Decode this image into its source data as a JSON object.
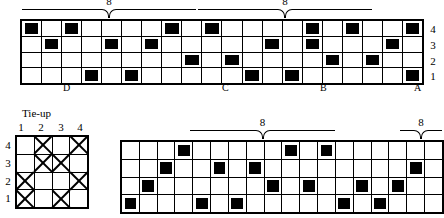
{
  "chart_data": {
    "type": "table",
    "grids": [
      {
        "name": "threading-draft",
        "rows": 4,
        "cols": 20,
        "row_labels": [
          "4",
          "3",
          "2",
          "1"
        ],
        "filled": [
          [
            1,
            3,
            8,
            10,
            15,
            17,
            20
          ],
          [
            2,
            5,
            7,
            13,
            15,
            19
          ],
          [
            9,
            11,
            16,
            18
          ],
          [
            4,
            6,
            12,
            14,
            20
          ]
        ],
        "letters": [
          {
            "label": "D",
            "col": 4
          },
          {
            "label": "C",
            "col": 12
          },
          {
            "label": "B",
            "col": 17
          },
          {
            "label": "A",
            "col": 20
          }
        ],
        "brackets": [
          {
            "label": "8",
            "start_col": 4,
            "end_col": 12
          },
          {
            "label": "8",
            "start_col": 12,
            "end_col": 20
          }
        ]
      },
      {
        "name": "tie-up",
        "title": "Tie-up",
        "rows": 4,
        "cols": 4,
        "row_labels": [
          "4",
          "3",
          "2",
          "1"
        ],
        "col_labels": [
          "1",
          "2",
          "3",
          "4"
        ],
        "marked": [
          [
            2,
            4
          ],
          [
            2,
            3
          ],
          [
            1,
            4
          ],
          [
            1,
            3
          ]
        ]
      },
      {
        "name": "treadling-draft",
        "rows": 4,
        "cols": 18,
        "filled": [
          [
            4,
            10,
            12
          ],
          [
            3,
            6,
            8,
            17
          ],
          [
            2,
            9,
            11,
            14,
            16
          ],
          [
            1,
            5,
            7,
            13,
            15
          ]
        ],
        "brackets": [
          {
            "label": "8",
            "start_col": 5,
            "end_col": 9
          },
          {
            "label": "8",
            "start_col": 16,
            "end_col": 18
          }
        ]
      }
    ]
  },
  "threading": {
    "row_labels": [
      "4",
      "3",
      "2",
      "1"
    ],
    "letters": [
      "D",
      "C",
      "B",
      "A"
    ],
    "bracket_left_label": "8",
    "bracket_right_label": "8"
  },
  "tieup": {
    "title": "Tie-up",
    "col_labels": [
      "1",
      "2",
      "3",
      "4"
    ],
    "row_labels": [
      "4",
      "3",
      "2",
      "1"
    ]
  },
  "treadling": {
    "bracket_left_label": "8",
    "bracket_right_label": "8"
  }
}
